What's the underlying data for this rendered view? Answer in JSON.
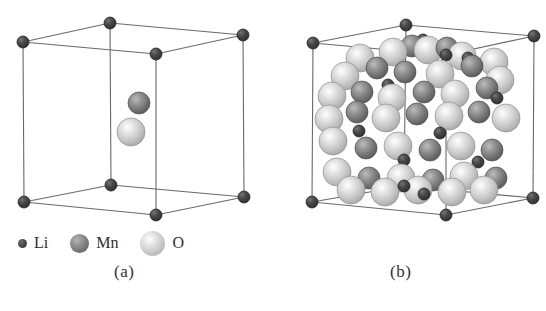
{
  "figure": {
    "background_color": "#ffffff",
    "panels": [
      {
        "id": "a",
        "caption": "(a)",
        "description": "unit-cell-sparse"
      },
      {
        "id": "b",
        "caption": "(b)",
        "description": "unit-cell-dense"
      }
    ]
  },
  "legend": {
    "entries": [
      {
        "key": "li",
        "label": "Li",
        "icon": "sphere-small-dark",
        "color": "#4a4a4a",
        "radius_px": 4.5
      },
      {
        "key": "mn",
        "label": "Mn",
        "icon": "sphere-medium-gray",
        "color": "#8d8d8d",
        "radius_px": 9.5
      },
      {
        "key": "o",
        "label": "O",
        "icon": "sphere-large-light",
        "color": "#d0d0d0",
        "radius_px": 12.5
      }
    ]
  },
  "chart_data": {
    "type": "scatter",
    "title": "",
    "xlabel": "",
    "ylabel": "",
    "legend_position": "bottom-left",
    "grid": false,
    "panel_a": {
      "caption": "(a)",
      "cube_vertices": {
        "front_top_left": [
          23,
          42
        ],
        "front_top_right": [
          156,
          54
        ],
        "front_bottom_left": [
          24,
          202
        ],
        "front_bottom_right": [
          156,
          215
        ],
        "back_top_left": [
          110,
          23
        ],
        "back_top_right": [
          243,
          35
        ],
        "back_bottom_left": [
          111,
          185
        ],
        "back_bottom_right": [
          244,
          197
        ]
      },
      "atoms": [
        {
          "el": "Li",
          "x": 23,
          "y": 42,
          "r": 6
        },
        {
          "el": "Li",
          "x": 156,
          "y": 54,
          "r": 6
        },
        {
          "el": "Li",
          "x": 24,
          "y": 202,
          "r": 6
        },
        {
          "el": "Li",
          "x": 156,
          "y": 215,
          "r": 6
        },
        {
          "el": "Li",
          "x": 110,
          "y": 23,
          "r": 6
        },
        {
          "el": "Li",
          "x": 243,
          "y": 35,
          "r": 6
        },
        {
          "el": "Li",
          "x": 111,
          "y": 185,
          "r": 6
        },
        {
          "el": "Li",
          "x": 244,
          "y": 197,
          "r": 6
        },
        {
          "el": "Mn",
          "x": 139,
          "y": 103,
          "r": 11
        },
        {
          "el": "O",
          "x": 131,
          "y": 132,
          "r": 14
        }
      ]
    },
    "panel_b": {
      "caption": "(b)",
      "cube_vertices": {
        "front_top_left": [
          313,
          43
        ],
        "front_top_right": [
          446,
          55
        ],
        "front_bottom_left": [
          312,
          202
        ],
        "front_bottom_right": [
          446,
          215
        ],
        "back_top_left": [
          406,
          25
        ],
        "back_top_right": [
          534,
          36
        ],
        "back_bottom_left": [
          404,
          186
        ],
        "back_bottom_right": [
          533,
          198
        ]
      },
      "atoms": [
        {
          "el": "Li",
          "x": 313,
          "y": 43,
          "r": 6
        },
        {
          "el": "Li",
          "x": 446,
          "y": 55,
          "r": 6
        },
        {
          "el": "Li",
          "x": 312,
          "y": 202,
          "r": 6
        },
        {
          "el": "Li",
          "x": 446,
          "y": 215,
          "r": 6
        },
        {
          "el": "Li",
          "x": 406,
          "y": 25,
          "r": 6
        },
        {
          "el": "Li",
          "x": 534,
          "y": 36,
          "r": 6
        },
        {
          "el": "Li",
          "x": 404,
          "y": 186,
          "r": 6
        },
        {
          "el": "Li",
          "x": 533,
          "y": 198,
          "r": 6
        },
        {
          "el": "O",
          "x": 360,
          "y": 58,
          "r": 14
        },
        {
          "el": "O",
          "x": 393,
          "y": 52,
          "r": 14
        },
        {
          "el": "O",
          "x": 428,
          "y": 50,
          "r": 14
        },
        {
          "el": "O",
          "x": 462,
          "y": 56,
          "r": 14
        },
        {
          "el": "O",
          "x": 494,
          "y": 62,
          "r": 14
        },
        {
          "el": "Mn",
          "x": 412,
          "y": 46,
          "r": 11
        },
        {
          "el": "Li",
          "x": 423,
          "y": 40,
          "r": 6
        },
        {
          "el": "Mn",
          "x": 447,
          "y": 48,
          "r": 11
        },
        {
          "el": "O",
          "x": 345,
          "y": 76,
          "r": 14
        },
        {
          "el": "Mn",
          "x": 377,
          "y": 68,
          "r": 11
        },
        {
          "el": "Mn",
          "x": 405,
          "y": 72,
          "r": 11
        },
        {
          "el": "O",
          "x": 440,
          "y": 74,
          "r": 14
        },
        {
          "el": "Mn",
          "x": 472,
          "y": 66,
          "r": 11
        },
        {
          "el": "O",
          "x": 500,
          "y": 80,
          "r": 14
        },
        {
          "el": "Li",
          "x": 468,
          "y": 58,
          "r": 6
        },
        {
          "el": "Li",
          "x": 388,
          "y": 85,
          "r": 6
        },
        {
          "el": "Li",
          "x": 497,
          "y": 98,
          "r": 6
        },
        {
          "el": "O",
          "x": 332,
          "y": 96,
          "r": 14
        },
        {
          "el": "Mn",
          "x": 362,
          "y": 92,
          "r": 11
        },
        {
          "el": "O",
          "x": 392,
          "y": 98,
          "r": 14
        },
        {
          "el": "Mn",
          "x": 424,
          "y": 92,
          "r": 11
        },
        {
          "el": "O",
          "x": 455,
          "y": 94,
          "r": 14
        },
        {
          "el": "Mn",
          "x": 487,
          "y": 88,
          "r": 11
        },
        {
          "el": "O",
          "x": 329,
          "y": 119,
          "r": 14
        },
        {
          "el": "Mn",
          "x": 357,
          "y": 112,
          "r": 11
        },
        {
          "el": "O",
          "x": 386,
          "y": 118,
          "r": 14
        },
        {
          "el": "Mn",
          "x": 417,
          "y": 114,
          "r": 11
        },
        {
          "el": "O",
          "x": 449,
          "y": 116,
          "r": 14
        },
        {
          "el": "Mn",
          "x": 479,
          "y": 112,
          "r": 11
        },
        {
          "el": "O",
          "x": 506,
          "y": 118,
          "r": 14
        },
        {
          "el": "Li",
          "x": 359,
          "y": 131,
          "r": 6
        },
        {
          "el": "Li",
          "x": 440,
          "y": 133,
          "r": 6
        },
        {
          "el": "O",
          "x": 333,
          "y": 141,
          "r": 14
        },
        {
          "el": "Mn",
          "x": 366,
          "y": 148,
          "r": 11
        },
        {
          "el": "O",
          "x": 398,
          "y": 146,
          "r": 14
        },
        {
          "el": "Mn",
          "x": 430,
          "y": 150,
          "r": 11
        },
        {
          "el": "O",
          "x": 461,
          "y": 146,
          "r": 14
        },
        {
          "el": "Mn",
          "x": 492,
          "y": 150,
          "r": 11
        },
        {
          "el": "Li",
          "x": 404,
          "y": 160,
          "r": 6
        },
        {
          "el": "Li",
          "x": 478,
          "y": 162,
          "r": 6
        },
        {
          "el": "O",
          "x": 337,
          "y": 172,
          "r": 14
        },
        {
          "el": "Mn",
          "x": 369,
          "y": 178,
          "r": 11
        },
        {
          "el": "O",
          "x": 401,
          "y": 178,
          "r": 14
        },
        {
          "el": "Mn",
          "x": 433,
          "y": 180,
          "r": 11
        },
        {
          "el": "O",
          "x": 464,
          "y": 176,
          "r": 14
        },
        {
          "el": "Mn",
          "x": 496,
          "y": 178,
          "r": 11
        },
        {
          "el": "Li",
          "x": 424,
          "y": 194,
          "r": 6
        },
        {
          "el": "O",
          "x": 351,
          "y": 190,
          "r": 14
        },
        {
          "el": "O",
          "x": 385,
          "y": 192,
          "r": 14
        },
        {
          "el": "O",
          "x": 418,
          "y": 190,
          "r": 14
        },
        {
          "el": "O",
          "x": 452,
          "y": 192,
          "r": 14
        },
        {
          "el": "O",
          "x": 484,
          "y": 190,
          "r": 14
        }
      ]
    }
  }
}
